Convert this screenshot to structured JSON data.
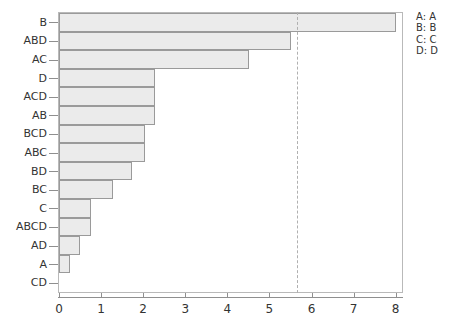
{
  "chart_data": {
    "type": "bar",
    "orientation": "horizontal",
    "title": "",
    "xlabel": "",
    "ylabel": "",
    "xlim": [
      0,
      8.15
    ],
    "xticks": [
      0,
      1,
      2,
      3,
      4,
      5,
      6,
      7,
      8
    ],
    "xtick_labels": [
      "0",
      "1",
      "2",
      "3",
      "4",
      "5",
      "6",
      "7",
      "8"
    ],
    "grid": false,
    "categories": [
      "B",
      "ABD",
      "AC",
      "D",
      "ACD",
      "AB",
      "BCD",
      "ABC",
      "BD",
      "BC",
      "C",
      "ABCD",
      "AD",
      "A",
      "CD"
    ],
    "values": [
      8.0,
      5.52,
      4.52,
      2.28,
      2.28,
      2.28,
      2.04,
      2.04,
      1.73,
      1.28,
      0.76,
      0.76,
      0.5,
      0.26,
      0.0
    ],
    "bar_fill_color": "#ebebeb",
    "bar_edge_color": "#9a9a9a",
    "annotations": [
      {
        "name": "threshold",
        "type": "vline",
        "value": 5.65,
        "style": "dashed",
        "color": "#b0b0b0"
      }
    ],
    "legend": {
      "position": "right-outside",
      "entries": [
        {
          "key": "A:",
          "label": "A"
        },
        {
          "key": "B:",
          "label": "B"
        },
        {
          "key": "C:",
          "label": "C"
        },
        {
          "key": "D:",
          "label": "D"
        }
      ]
    }
  }
}
